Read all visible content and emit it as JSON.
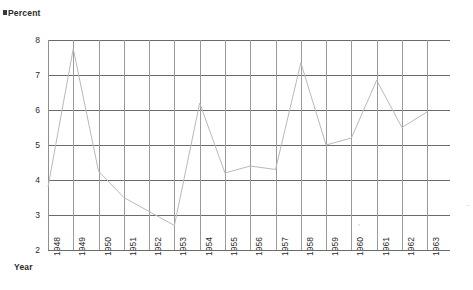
{
  "chart_data": {
    "type": "line",
    "title": "",
    "xlabel": "Year",
    "ylabel": "Percent",
    "ylim": [
      2,
      8
    ],
    "yticks": [
      2,
      3,
      4,
      5,
      6,
      7,
      8
    ],
    "grid": true,
    "legend": null,
    "categories": [
      "1948",
      "1949",
      "1950",
      "1951",
      "1952",
      "1953",
      "1954",
      "1955",
      "1956",
      "1957",
      "1958",
      "1959",
      "1960",
      "1961",
      "1962",
      "1963"
    ],
    "series": [
      {
        "name": "Percent",
        "color": "#b9b9b9",
        "values": [
          3.8,
          7.75,
          4.25,
          3.5,
          3.1,
          2.7,
          6.2,
          4.2,
          4.4,
          4.3,
          7.35,
          5.0,
          5.2,
          6.85,
          5.5,
          5.95
        ]
      }
    ]
  },
  "axes": {
    "y_title": "Percent",
    "x_title": "Year",
    "y_tick_labels": [
      "8",
      "7",
      "6",
      "5",
      "4",
      "3",
      "2"
    ],
    "x_tick_labels": [
      "1948",
      "1949",
      "1950",
      "1951",
      "1952",
      "1953",
      "1954",
      "1955",
      "1956",
      "1957",
      "1958",
      "1959",
      "1960",
      "1961",
      "1962",
      "1963"
    ]
  },
  "colors": {
    "line": "#b9b9b9",
    "gridline_horizontal": "#6b6b6b",
    "gridline_vertical": "#9b9b9b",
    "text": "#2b2b2b",
    "background": "#ffffff"
  }
}
